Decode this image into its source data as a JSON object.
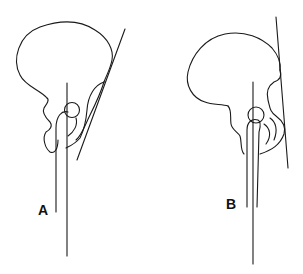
{
  "figure": {
    "panels": [
      {
        "id": "A",
        "label": "A",
        "description": "Pelvis lateral view with tangent line inclined (anterior pelvic plane tilted)"
      },
      {
        "id": "B",
        "label": "B",
        "description": "Pelvis lateral view with tangent line near vertical"
      }
    ],
    "colors": {
      "line": "#1a1a1a",
      "background": "#ffffff"
    }
  }
}
